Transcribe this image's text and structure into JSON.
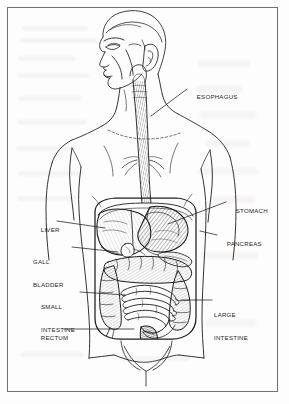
{
  "figure": {
    "view": "anterior view of male torso, head in three-quarter left profile",
    "style": "black and white pen-and-ink line drawing on off-white printed page",
    "frame_color": "#6e7175",
    "ink_color": "#1d1d1d",
    "page_color": "#fdfdfd"
  },
  "labels": [
    {
      "id": "esophagus",
      "text": "ESOPHAGUS",
      "text2": "",
      "side": "right",
      "x": 189,
      "y": 85,
      "leader": {
        "x1": 187,
        "y1": 89,
        "x2": 151,
        "y2": 116
      }
    },
    {
      "id": "stomach",
      "text": "STOMACH",
      "text2": "",
      "side": "right",
      "x": 228,
      "y": 199,
      "leader": {
        "x1": 226,
        "y1": 202,
        "x2": 168,
        "y2": 224
      }
    },
    {
      "id": "pancreas",
      "text": "PANCREAS",
      "text2": "",
      "side": "right",
      "x": 219,
      "y": 232,
      "leader": {
        "x1": 217,
        "y1": 235,
        "x2": 200,
        "y2": 231
      }
    },
    {
      "id": "large-intestine",
      "text": "LARGE",
      "text2": "INTESTINE",
      "side": "right",
      "x": 214,
      "y": 296,
      "leader": {
        "x1": 212,
        "y1": 300,
        "x2": 181,
        "y2": 300
      }
    },
    {
      "id": "liver",
      "text": "LIVER",
      "text2": "",
      "side": "left",
      "x": 33,
      "y": 218,
      "leader": {
        "x1": 57,
        "y1": 221,
        "x2": 105,
        "y2": 228
      }
    },
    {
      "id": "gall-bladder",
      "text": "GALL",
      "text2": "BLADDER",
      "side": "left",
      "x": 33,
      "y": 243,
      "leader": {
        "x1": 72,
        "y1": 247,
        "x2": 118,
        "y2": 252
      }
    },
    {
      "id": "small-intestine",
      "text": "SMALL",
      "text2": "INTESTINE",
      "side": "left",
      "x": 41,
      "y": 288,
      "leader": {
        "x1": 80,
        "y1": 292,
        "x2": 125,
        "y2": 295
      }
    },
    {
      "id": "rectum",
      "text": "RECTUM",
      "text2": "",
      "side": "left",
      "x": 33,
      "y": 326,
      "leader": {
        "x1": 64,
        "y1": 329,
        "x2": 134,
        "y2": 329
      }
    }
  ],
  "organs": [
    {
      "id": "esophagus",
      "name": "Esophagus"
    },
    {
      "id": "stomach",
      "name": "Stomach"
    },
    {
      "id": "pancreas",
      "name": "Pancreas"
    },
    {
      "id": "liver",
      "name": "Liver"
    },
    {
      "id": "gall-bladder",
      "name": "Gall bladder"
    },
    {
      "id": "small-intestine",
      "name": "Small intestine"
    },
    {
      "id": "large-intestine",
      "name": "Large intestine"
    },
    {
      "id": "rectum",
      "name": "Rectum"
    }
  ]
}
